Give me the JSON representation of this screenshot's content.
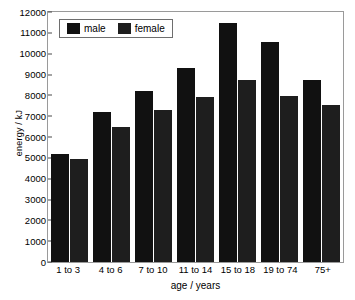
{
  "chart_data": {
    "type": "bar",
    "title": "",
    "xlabel": "age / years",
    "ylabel": "energy / kJ",
    "categories": [
      "1 to 3",
      "4 to 6",
      "7 to 10",
      "11 to 14",
      "15 to 18",
      "19 to 74",
      "75+"
    ],
    "series": [
      {
        "name": "male",
        "color": "#111111",
        "values": [
          5200,
          7200,
          8200,
          9300,
          11450,
          10550,
          8750
        ]
      },
      {
        "name": "female",
        "color": "#1e1e1e",
        "values": [
          4950,
          6500,
          7300,
          7900,
          8750,
          7950,
          7550
        ]
      }
    ],
    "ylim": [
      0,
      12000
    ],
    "ytick_values": [
      0,
      1000,
      2000,
      3000,
      4000,
      5000,
      6000,
      7000,
      8000,
      9000,
      10000,
      11000,
      12000
    ],
    "ytick_labels": [
      "0",
      "1000",
      "2000",
      "3000",
      "4000",
      "5000",
      "6000",
      "7000",
      "8000",
      "9000",
      "10000",
      "11000",
      "12000"
    ],
    "grid": false,
    "legend_position": "top-left",
    "legend_entries": [
      "male",
      "female"
    ]
  }
}
